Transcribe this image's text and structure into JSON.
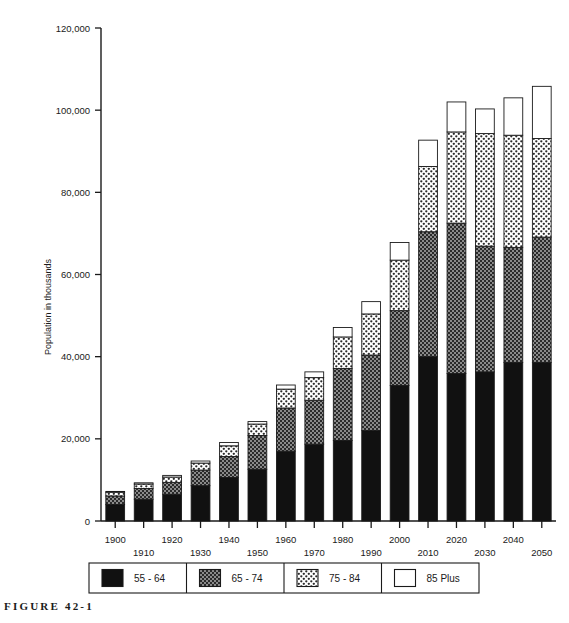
{
  "figure": {
    "caption": "FIGURE 42-1"
  },
  "chart_data": {
    "type": "bar",
    "subtype": "stacked-vertical",
    "title": "",
    "xlabel": "",
    "ylabel": "Population in thousands",
    "ylim": [
      0,
      120000
    ],
    "ytick_values": [
      0,
      20000,
      40000,
      60000,
      80000,
      100000,
      120000
    ],
    "ytick_labels": [
      "0",
      "20,000",
      "40,000",
      "60,000",
      "80,000",
      "100,000",
      "120,000"
    ],
    "grid": false,
    "legend_position": "bottom",
    "categories": [
      "1900",
      "1910",
      "1920",
      "1930",
      "1940",
      "1950",
      "1960",
      "1970",
      "1980",
      "1990",
      "2000",
      "2010",
      "2020",
      "2030",
      "2040",
      "2050"
    ],
    "series": [
      {
        "name": "55 - 64",
        "fill": "solid-black",
        "color": "#111111",
        "values": [
          4000,
          5300,
          6500,
          8600,
          10600,
          12600,
          17000,
          18700,
          19600,
          22000,
          33000,
          40000,
          35900,
          36300,
          38600,
          38600
        ]
      },
      {
        "name": "65 - 74",
        "fill": "dark-checker",
        "color": "#6f6f6f",
        "values": [
          2100,
          2600,
          2900,
          3800,
          5100,
          8200,
          10500,
          10700,
          17500,
          18400,
          18200,
          30400,
          36600,
          30600,
          28000,
          30500
        ]
      },
      {
        "name": "75 - 84",
        "fill": "light-checker",
        "color": "#d8d8d8",
        "values": [
          900,
          1100,
          1300,
          1700,
          2600,
          2800,
          4600,
          5500,
          7700,
          10000,
          12300,
          15900,
          22200,
          27400,
          27300,
          24000
        ]
      },
      {
        "name": "85 Plus",
        "fill": "white",
        "color": "#ffffff",
        "values": [
          200,
          300,
          400,
          500,
          800,
          600,
          1000,
          1400,
          2300,
          3000,
          4300,
          6400,
          7300,
          6000,
          9100,
          12700
        ]
      }
    ],
    "totals": [
      7200,
      9300,
      11100,
      14600,
      19100,
      24200,
      33100,
      36300,
      47100,
      53400,
      67800,
      92700,
      102000,
      100300,
      103000,
      105800
    ],
    "legend_entries": [
      {
        "label": "55 - 64",
        "pattern": "solid-black"
      },
      {
        "label": "65 - 74",
        "pattern": "dark-checker"
      },
      {
        "label": "75 - 84",
        "pattern": "light-checker"
      },
      {
        "label": "85 Plus",
        "pattern": "white"
      }
    ]
  }
}
